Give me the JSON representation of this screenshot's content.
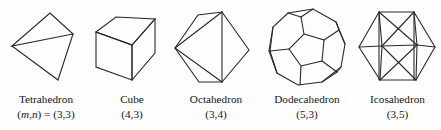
{
  "figure": {
    "background_color": "#fdfdfd",
    "stroke_color": "#2a2a2a",
    "text_color": "#161616",
    "solids": [
      {
        "id": "tetrahedron",
        "name": "Tetrahedron",
        "schlafli_prefix": "(",
        "schlafli_m": "m",
        "schlafli_comma": ",",
        "schlafli_n": "n",
        "schlafli_suffix": ") = (3,3)",
        "schlafli_plain": "(m,n) = (3,3)",
        "faces": 4,
        "face_sides": 3,
        "vertex_degree": 3
      },
      {
        "id": "cube",
        "name": "Cube",
        "schlafli_plain": "(4,3)",
        "faces": 6,
        "face_sides": 4,
        "vertex_degree": 3
      },
      {
        "id": "octahedron",
        "name": "Octahedron",
        "schlafli_plain": "(3,4)",
        "faces": 8,
        "face_sides": 3,
        "vertex_degree": 4
      },
      {
        "id": "dodecahedron",
        "name": "Dodecahedron",
        "schlafli_plain": "(5,3)",
        "faces": 12,
        "face_sides": 5,
        "vertex_degree": 3
      },
      {
        "id": "icosahedron",
        "name": "Icosahedron",
        "schlafli_plain": "(3,5)",
        "faces": 20,
        "face_sides": 3,
        "vertex_degree": 5
      }
    ]
  }
}
